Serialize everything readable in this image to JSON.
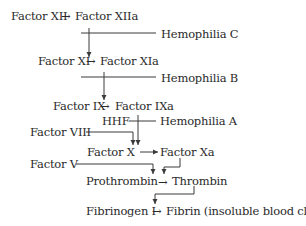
{
  "diagram": {
    "type": "coagulation-cascade",
    "rows": [
      {
        "left": "Factor XII",
        "arrow": "→",
        "right": "Factor XIIa"
      },
      {
        "left": "Factor XI",
        "arrow": "→",
        "right": "Factor XIa"
      },
      {
        "left": "Factor IX",
        "arrow": "→",
        "right": "Factor IXa"
      },
      {
        "left": "Factor X",
        "arrow": "→",
        "right": "Factor Xa"
      },
      {
        "left": "Prothrombin",
        "arrow": "→",
        "right": "Thrombin"
      },
      {
        "left": "Fibrinogen I",
        "arrow": "→",
        "right": "Fibrin (insoluble blood clot)"
      }
    ],
    "deficiencies": [
      {
        "label": "Hemophilia C"
      },
      {
        "label": "Hemophilia B"
      },
      {
        "label": "Hemophilia A"
      }
    ],
    "cofactors": [
      {
        "label": "HHF"
      },
      {
        "label": "Factor VIII"
      },
      {
        "label": "Factor V"
      }
    ],
    "line_color": "#3a3a3a",
    "text_color": "#2a2a2a"
  }
}
